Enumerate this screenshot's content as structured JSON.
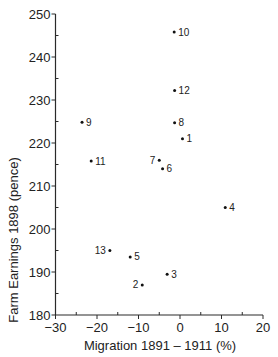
{
  "chart_data": {
    "type": "scatter",
    "title": "",
    "xlabel": "Migration  1891 – 1911  (%)",
    "ylabel": "Farm  Earnings  1898  (pence)",
    "xlim": [
      -30,
      20
    ],
    "ylim": [
      180,
      250
    ],
    "x_ticks": [
      -30,
      -20,
      -10,
      0,
      10,
      20
    ],
    "x_minor_ticks": [
      -25,
      -15,
      -5,
      5,
      15
    ],
    "y_ticks": [
      180,
      190,
      200,
      210,
      220,
      230,
      240,
      250
    ],
    "y_minor_ticks": [
      185,
      195,
      205,
      215,
      225,
      235,
      245
    ],
    "grid": false,
    "legend": null,
    "points": [
      {
        "label": "1",
        "x": 0.6,
        "y": 221,
        "label_side": "right"
      },
      {
        "label": "2",
        "x": -9.1,
        "y": 187,
        "label_side": "left"
      },
      {
        "label": "3",
        "x": -3.1,
        "y": 189.5,
        "label_side": "right"
      },
      {
        "label": "4",
        "x": 10.9,
        "y": 205,
        "label_side": "right"
      },
      {
        "label": "5",
        "x": -12,
        "y": 193.5,
        "label_side": "right"
      },
      {
        "label": "6",
        "x": -4.2,
        "y": 214,
        "label_side": "right"
      },
      {
        "label": "7",
        "x": -5,
        "y": 216,
        "label_side": "left"
      },
      {
        "label": "8",
        "x": -1.3,
        "y": 224.7,
        "label_side": "right"
      },
      {
        "label": "9",
        "x": -23.6,
        "y": 224.8,
        "label_side": "right"
      },
      {
        "label": "10",
        "x": -1.4,
        "y": 245.8,
        "label_side": "right"
      },
      {
        "label": "11",
        "x": -21.4,
        "y": 215.8,
        "label_side": "right"
      },
      {
        "label": "12",
        "x": -1.3,
        "y": 232.2,
        "label_side": "right"
      },
      {
        "label": "13",
        "x": -16.9,
        "y": 195,
        "label_side": "left"
      }
    ]
  }
}
